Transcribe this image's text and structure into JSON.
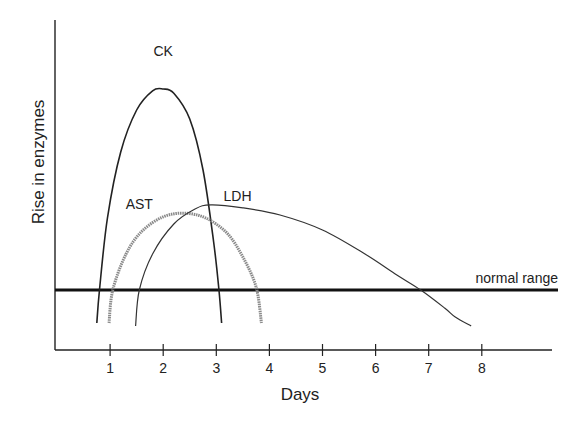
{
  "chart_data": {
    "type": "line",
    "title": "",
    "xlabel": "Days",
    "ylabel": "Rise in enzymes",
    "xlim": [
      0,
      9.3
    ],
    "ylim": [
      0,
      5.5
    ],
    "x_ticks": [
      1,
      2,
      3,
      4,
      5,
      6,
      7,
      8
    ],
    "y_ticks": [],
    "grid": false,
    "legend": "none (curves labeled directly)",
    "reference_line": {
      "label": "normal range",
      "y": 1.0
    },
    "series": [
      {
        "name": "CK",
        "label_pos": {
          "x": 2.0,
          "y": 4.9
        },
        "stroke": "#222222",
        "width": 1.6,
        "points": [
          [
            0.75,
            0.45
          ],
          [
            0.8,
            1.0
          ],
          [
            0.95,
            2.2
          ],
          [
            1.2,
            3.3
          ],
          [
            1.5,
            4.0
          ],
          [
            1.8,
            4.32
          ],
          [
            2.0,
            4.35
          ],
          [
            2.2,
            4.28
          ],
          [
            2.5,
            3.85
          ],
          [
            2.75,
            3.0
          ],
          [
            2.95,
            1.8
          ],
          [
            3.05,
            1.0
          ],
          [
            3.1,
            0.45
          ]
        ]
      },
      {
        "name": "AST",
        "label_pos": {
          "x": 1.55,
          "y": 2.35
        },
        "stroke": "#8a8a8a",
        "width": 3.0,
        "points": [
          [
            0.98,
            0.45
          ],
          [
            1.05,
            1.0
          ],
          [
            1.3,
            1.6
          ],
          [
            1.6,
            1.98
          ],
          [
            2.0,
            2.22
          ],
          [
            2.4,
            2.28
          ],
          [
            2.8,
            2.2
          ],
          [
            3.2,
            1.95
          ],
          [
            3.5,
            1.55
          ],
          [
            3.75,
            1.05
          ],
          [
            3.85,
            0.45
          ]
        ]
      },
      {
        "name": "LDH",
        "label_pos": {
          "x": 3.4,
          "y": 2.48
        },
        "stroke": "#333333",
        "width": 1.2,
        "points": [
          [
            1.48,
            0.4
          ],
          [
            1.55,
            1.0
          ],
          [
            1.8,
            1.6
          ],
          [
            2.2,
            2.1
          ],
          [
            2.6,
            2.35
          ],
          [
            2.9,
            2.42
          ],
          [
            3.5,
            2.37
          ],
          [
            4.2,
            2.25
          ],
          [
            5.0,
            2.0
          ],
          [
            5.8,
            1.6
          ],
          [
            6.4,
            1.25
          ],
          [
            6.85,
            1.0
          ],
          [
            7.3,
            0.7
          ],
          [
            7.5,
            0.55
          ],
          [
            7.8,
            0.4
          ]
        ]
      }
    ]
  }
}
